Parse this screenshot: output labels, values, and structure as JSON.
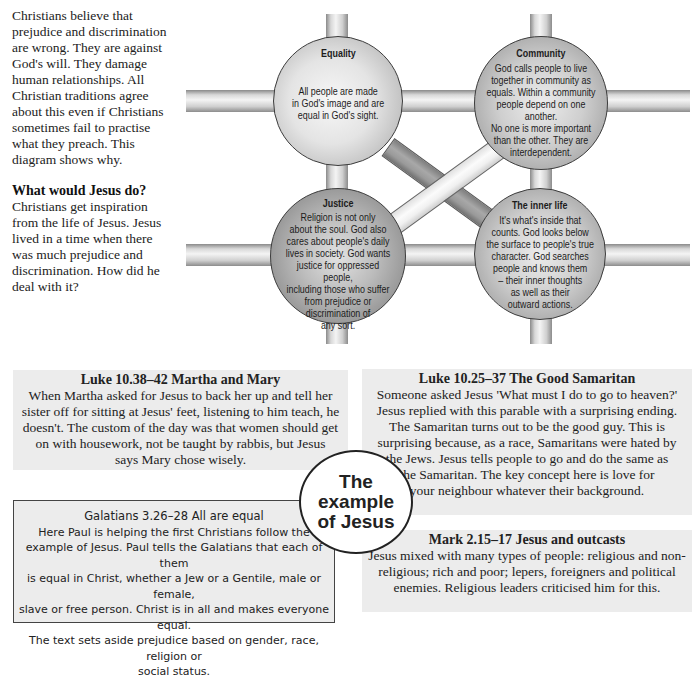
{
  "intro": {
    "paragraph": "Christians believe that prejudice and discrimination are wrong.  They are against God's will. They damage human relationships. All Christian traditions agree about this even if Christians sometimes fail to practise what they preach. This diagram shows why.",
    "heading": "What would Jesus do?",
    "paragraph2": "Christians get inspiration from the life of Jesus. Jesus lived in a time when there was much prejudice and discrimination. How did he deal with it?"
  },
  "diagram": {
    "spheres": [
      {
        "title": "Equality",
        "text": "All people are made\nin God's image and are\nequal in God's sight."
      },
      {
        "title": "Community",
        "text": "God calls people to live\ntogether in community as\nequals. Within a community\npeople depend on one another.\nNo one is more important\nthan the other. They are\ninterdependent."
      },
      {
        "title": "Justice",
        "text": "Religion is not only\nabout the soul. God also\ncares about people's daily\nlives in society. God wants\njustice for oppressed people,\nincluding those who suffer\nfrom prejudice or\ndiscrimination of\nany sort."
      },
      {
        "title": "The inner life",
        "text": "It's what's inside that\ncounts. God looks below\nthe surface to people's true\ncharacter. God searches\npeople and knows them\n– their inner thoughts\nas well as their\noutward actions."
      }
    ]
  },
  "boxes": {
    "martha": {
      "heading": "Luke 10.38–42 Martha and Mary",
      "text": "When Martha asked for Jesus to back her up and tell her\nsister off for sitting at Jesus' feet, listening to him teach, he\ndoesn't. The custom of the day was that women should get\non with housework, not be taught by rabbis, but Jesus\nsays Mary chose wisely."
    },
    "samaritan": {
      "heading": "Luke 10.25–37 The Good Samaritan",
      "text": "Someone asked Jesus 'What must I do to go to heaven?'\nJesus replied with this parable with a surprising ending.\nThe Samaritan turns out to be the good guy. This is\nsurprising because, as a race, Samaritans were hated by\nthe Jews. Jesus tells people to go and do the same as\nthe Samaritan. The key concept here is love for\nyour neighbour whatever their background."
    },
    "galatians": {
      "heading": "Galatians 3.26–28 All are equal",
      "text": "Here Paul is helping the first Christians follow the\nexample of Jesus. Paul tells the Galatians that each of them\nis equal in Christ, whether a Jew or a Gentile, male or female,\nslave or free person. Christ is in all and makes everyone equal.\nThe text sets aside prejudice based on gender, race, religion or\nsocial status."
    },
    "mark": {
      "heading": "Mark 2.15–17 Jesus and outcasts",
      "text": "Jesus mixed with many types of people: religious and non-\nreligious; rich and poor; lepers, foreigners and political\nenemies. Religious leaders criticised him for this."
    }
  },
  "center_badge": "The\nexample\nof Jesus"
}
